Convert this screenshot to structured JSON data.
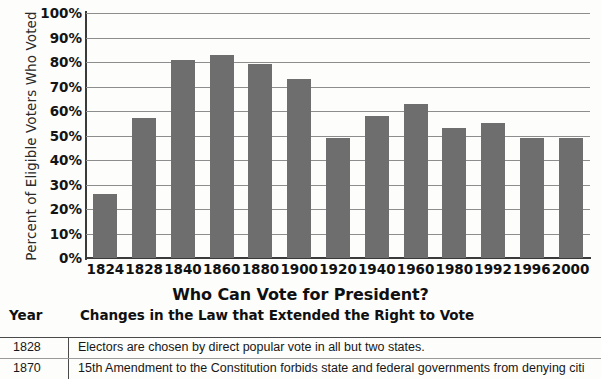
{
  "chart_data": {
    "type": "bar",
    "title": "",
    "xlabel": "",
    "ylabel": "Percent of Eligible Voters Who Voted",
    "ylim": [
      0,
      100
    ],
    "ytick_labels": [
      "100%",
      "90%",
      "80%",
      "70%",
      "60%",
      "50%",
      "40%",
      "30%",
      "20%",
      "10%",
      "0%"
    ],
    "ytick_values": [
      100,
      90,
      80,
      70,
      60,
      50,
      40,
      30,
      20,
      10,
      0
    ],
    "grid": true,
    "legend": "none",
    "bar_color": "#6e6e6e",
    "categories": [
      "1824",
      "1828",
      "1840",
      "1860",
      "1880",
      "1900",
      "1920",
      "1940",
      "1960",
      "1980",
      "1992",
      "1996",
      "2000"
    ],
    "values": [
      26,
      57,
      81,
      83,
      79,
      73,
      49,
      58,
      63,
      53,
      55,
      49,
      49
    ]
  },
  "table": {
    "title": "Who Can Vote for President?",
    "columns": [
      "Year",
      "Changes in the Law that Extended the Right to Vote"
    ],
    "rows": [
      {
        "year": "1828",
        "description": "Electors are chosen by direct popular vote in all but two states."
      },
      {
        "year": "1870",
        "description": "15th Amendment to the Constitution forbids state and federal governments from denying citi"
      }
    ]
  }
}
